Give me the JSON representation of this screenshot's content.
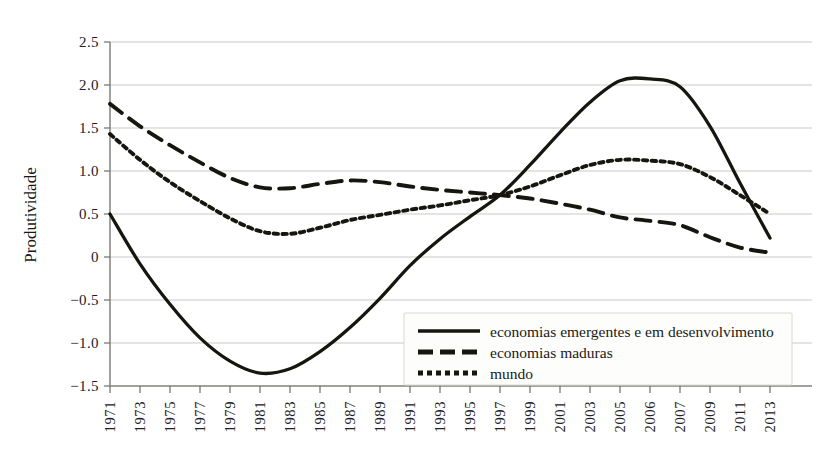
{
  "chart_data": {
    "type": "line",
    "title": "",
    "subtitle": "",
    "xlabel": "",
    "ylabel": "Produtividade",
    "ylim": [
      -1.5,
      2.5
    ],
    "yticks": [
      2.5,
      2.0,
      1.5,
      1.0,
      0.5,
      0,
      -0.5,
      -1.0,
      -1.5
    ],
    "ytick_labels": [
      "2.5",
      "2.0",
      "1.5",
      "1.0",
      "0.5",
      "0",
      "-0.5",
      "-1.0",
      "-1.5"
    ],
    "grid": true,
    "legend_position": "bottom-right",
    "categories": [
      "1971",
      "1973",
      "1975",
      "1977",
      "1979",
      "1981",
      "1983",
      "1985",
      "1987",
      "1989",
      "1991",
      "1993",
      "1995",
      "1997",
      "1999",
      "2001",
      "2003",
      "2005",
      "2006",
      "2007",
      "2009",
      "2011",
      "2013"
    ],
    "x": [
      1971,
      1973,
      1975,
      1977,
      1979,
      1981,
      1983,
      1985,
      1987,
      1989,
      1991,
      1993,
      1995,
      1997,
      1999,
      2001,
      2003,
      2005,
      2006,
      2007,
      2009,
      2011,
      2013
    ],
    "series": [
      {
        "name": "economias emergentes e em desenvolvimento",
        "style": "solid",
        "color": "#16160f",
        "values": [
          0.5,
          -0.08,
          -0.55,
          -0.94,
          -1.21,
          -1.35,
          -1.3,
          -1.1,
          -0.82,
          -0.48,
          -0.1,
          0.21,
          0.47,
          0.72,
          1.07,
          1.45,
          1.8,
          2.05,
          2.07,
          1.98,
          1.52,
          0.86,
          0.22
        ]
      },
      {
        "name": "economias maduras",
        "style": "dashed",
        "color": "#16160f",
        "values": [
          1.78,
          1.52,
          1.3,
          1.1,
          0.92,
          0.81,
          0.8,
          0.85,
          0.89,
          0.87,
          0.82,
          0.78,
          0.75,
          0.72,
          0.68,
          0.62,
          0.55,
          0.46,
          0.42,
          0.37,
          0.23,
          0.11,
          0.05
        ]
      },
      {
        "name": "mundo",
        "style": "dotted",
        "color": "#16160f",
        "values": [
          1.43,
          1.13,
          0.87,
          0.65,
          0.45,
          0.3,
          0.27,
          0.34,
          0.43,
          0.49,
          0.55,
          0.6,
          0.66,
          0.72,
          0.82,
          0.95,
          1.07,
          1.13,
          1.12,
          1.08,
          0.93,
          0.72,
          0.5
        ]
      }
    ]
  },
  "axis": {
    "y_title": "Produtividade"
  },
  "legend": {
    "entries": [
      {
        "label": "economias emergentes e em desenvolvimento",
        "style": "solid"
      },
      {
        "label": "economias maduras",
        "style": "dashed"
      },
      {
        "label": "mundo",
        "style": "dotted"
      }
    ]
  }
}
